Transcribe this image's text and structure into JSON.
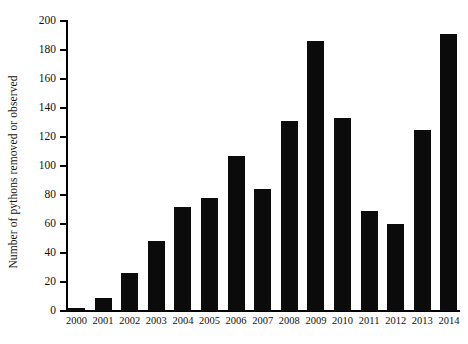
{
  "chart_data": {
    "type": "bar",
    "title": "",
    "subtitle": "",
    "xlabel": "",
    "ylabel": "Number of pythons removed or observed",
    "categories": [
      "2000",
      "2001",
      "2002",
      "2003",
      "2004",
      "2005",
      "2006",
      "2007",
      "2008",
      "2009",
      "2010",
      "2011",
      "2012",
      "2013",
      "2014"
    ],
    "values": [
      2,
      9,
      26,
      48,
      72,
      78,
      107,
      84,
      131,
      186,
      133,
      69,
      60,
      125,
      191
    ],
    "series": [
      {
        "name": "Pythons removed or observed",
        "values": [
          2,
          9,
          26,
          48,
          72,
          78,
          107,
          84,
          131,
          186,
          133,
          69,
          60,
          125,
          191
        ]
      }
    ],
    "ylim": [
      0,
      200
    ],
    "ytick_labels": [
      "0",
      "20",
      "40",
      "60",
      "80",
      "100",
      "120",
      "140",
      "160",
      "180",
      "200"
    ],
    "ytick_values": [
      0,
      20,
      40,
      60,
      80,
      100,
      120,
      140,
      160,
      180,
      200
    ],
    "grid": false,
    "legend": false,
    "legend_position": "none",
    "bar_color": "#0b0b0b",
    "axis_color": "#000000",
    "background_color": "#ffffff"
  }
}
